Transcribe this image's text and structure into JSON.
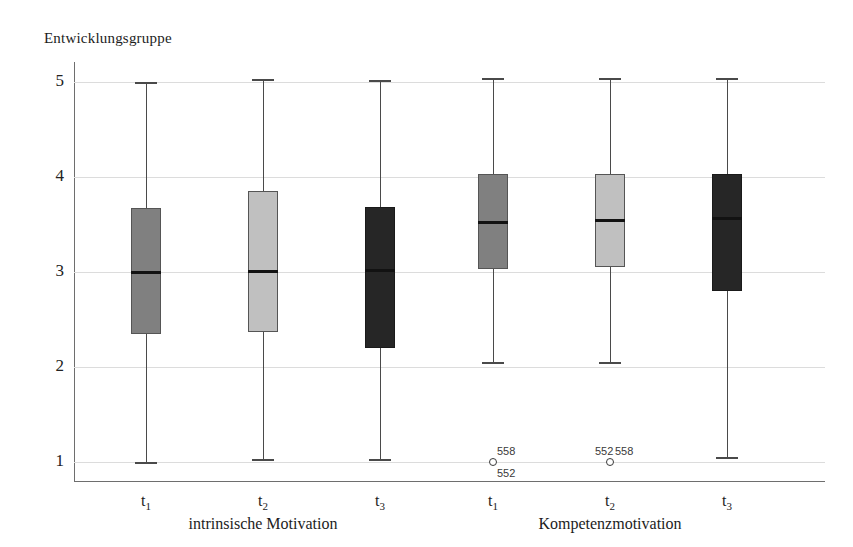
{
  "chart_data": {
    "type": "box",
    "title": "Entwicklungsgruppe",
    "xlabel": "",
    "ylabel": "Entwicklungsgruppe",
    "ylim": [
      1,
      5
    ],
    "yticks": [
      1,
      2,
      3,
      4,
      5
    ],
    "ytick_labels": [
      "1",
      "2",
      "3",
      "4",
      "5"
    ],
    "grid": true,
    "legend": "none",
    "categories": [
      "t₁",
      "t₂",
      "t₃",
      "t₁",
      "t₂",
      "t₃"
    ],
    "groups": [
      {
        "label": "intrinsische Motivation",
        "boxes": [
          0,
          1,
          2
        ]
      },
      {
        "label": "Kompetenzmotivation",
        "boxes": [
          3,
          4,
          5
        ]
      }
    ],
    "boxes": [
      {
        "name": "intrinsische Motivation t1",
        "tick": "t",
        "tick_sub": "1",
        "group": "intrinsische Motivation",
        "color": "#808080",
        "whisker_low": 1.0,
        "q1": 2.35,
        "median": 3.0,
        "q3": 3.67,
        "whisker_high": 5.0,
        "outliers": []
      },
      {
        "name": "intrinsische Motivation t2",
        "tick": "t",
        "tick_sub": "2",
        "group": "intrinsische Motivation",
        "color": "#c0c0c0",
        "whisker_low": 1.03,
        "q1": 2.37,
        "median": 3.01,
        "q3": 3.85,
        "whisker_high": 5.03,
        "outliers": []
      },
      {
        "name": "intrinsische Motivation t3",
        "tick": "t",
        "tick_sub": "3",
        "group": "intrinsische Motivation",
        "color": "#262626",
        "whisker_low": 1.03,
        "q1": 2.2,
        "median": 3.02,
        "q3": 3.68,
        "whisker_high": 5.02,
        "outliers": []
      },
      {
        "name": "Kompetenzmotivation t1",
        "tick": "t",
        "tick_sub": "1",
        "group": "Kompetenzmotivation",
        "color": "#808080",
        "whisker_low": 2.05,
        "q1": 3.03,
        "median": 3.53,
        "q3": 4.03,
        "whisker_high": 5.04,
        "outliers": [
          {
            "value": 1.0,
            "labels": [
              "558",
              "552"
            ],
            "label_positions": [
              "above",
              "below"
            ]
          }
        ]
      },
      {
        "name": "Kompetenzmotivation t2",
        "tick": "t",
        "tick_sub": "2",
        "group": "Kompetenzmotivation",
        "color": "#c0c0c0",
        "whisker_low": 2.05,
        "q1": 3.05,
        "median": 3.55,
        "q3": 4.03,
        "whisker_high": 5.04,
        "outliers": [
          {
            "value": 1.0,
            "labels": [
              "552",
              "558"
            ],
            "label_positions": [
              "above-left",
              "above-right"
            ]
          }
        ]
      },
      {
        "name": "Kompetenzmotivation t3",
        "tick": "t",
        "tick_sub": "3",
        "group": "Kompetenzmotivation",
        "color": "#262626",
        "whisker_low": 1.05,
        "q1": 2.8,
        "median": 3.57,
        "q3": 4.03,
        "whisker_high": 5.04,
        "outliers": []
      }
    ]
  },
  "axis": {
    "y_title": "Entwicklungsgruppe"
  }
}
